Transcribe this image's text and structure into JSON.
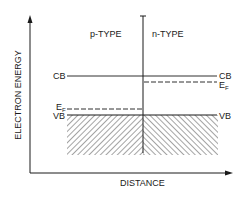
{
  "diagram": {
    "type": "p-n junction band diagram",
    "axes": {
      "y_label": "ELECTRON ENERGY",
      "x_label": "DISTANCE"
    },
    "regions": {
      "left": "p-TYPE",
      "right": "n-TYPE"
    },
    "levels": {
      "cb_left": "CB",
      "cb_right": "CB",
      "vb_left": "VB",
      "vb_right": "VB",
      "ef_left": {
        "main": "E",
        "sub": "F"
      },
      "ef_right": {
        "main": "E",
        "sub": "F"
      }
    },
    "colors": {
      "line": "#1a1a1a",
      "background": "#ffffff"
    }
  }
}
